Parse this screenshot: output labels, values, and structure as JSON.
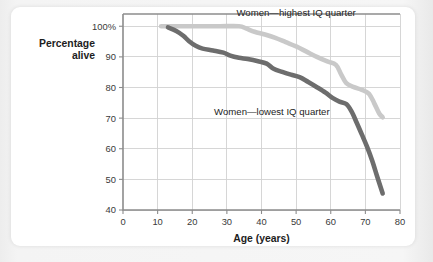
{
  "figure": {
    "card_background": "#ffffff",
    "page_background": "#f2f2f2"
  },
  "chart_data": {
    "type": "line",
    "title": "",
    "subtitle": "",
    "xlabel": "Age (years)",
    "ylabel": "Percentage\nalive",
    "ylabel_line1": "Percentage",
    "ylabel_line2": "alive",
    "xlim": [
      0,
      80
    ],
    "ylim": [
      40,
      104
    ],
    "xticks": [
      0,
      10,
      20,
      30,
      40,
      50,
      60,
      70,
      80
    ],
    "xtick_labels": [
      "0",
      "10",
      "20",
      "30",
      "40",
      "50",
      "60",
      "70",
      "80"
    ],
    "yticks": [
      40,
      50,
      60,
      70,
      80,
      90,
      100
    ],
    "ytick_labels": [
      "40",
      "50",
      "60",
      "70",
      "80",
      "90",
      "100%"
    ],
    "grid": true,
    "grid_color": "#d2d2d2",
    "legend": "inline-annotations",
    "series": [
      {
        "name": "Women—highest IQ quarter",
        "color": "#c9c9c9",
        "width": 4.6,
        "annotation": {
          "text": "Women—highest IQ quarter",
          "x": 50,
          "y": 103.2
        },
        "points": [
          [
            11.0,
            100.0
          ],
          [
            16.0,
            100.0
          ],
          [
            22.0,
            100.0
          ],
          [
            28.0,
            100.0
          ],
          [
            33.5,
            100.0
          ],
          [
            35.5,
            99.3
          ],
          [
            38.0,
            98.2
          ],
          [
            41.0,
            97.3
          ],
          [
            44.0,
            96.2
          ],
          [
            47.0,
            94.8
          ],
          [
            50.0,
            93.4
          ],
          [
            53.0,
            91.7
          ],
          [
            56.0,
            90.0
          ],
          [
            59.0,
            88.5
          ],
          [
            61.5,
            87.4
          ],
          [
            63.0,
            84.3
          ],
          [
            64.5,
            81.4
          ],
          [
            66.5,
            80.2
          ],
          [
            69.0,
            79.2
          ],
          [
            71.0,
            78.0
          ],
          [
            72.5,
            75.0
          ],
          [
            74.0,
            71.5
          ],
          [
            75.0,
            70.3
          ]
        ]
      },
      {
        "name": "Women—lowest IQ quarter",
        "color": "#6d6d6d",
        "width": 4.6,
        "annotation": {
          "text": "Women—lowest IQ quarter",
          "x": 43,
          "y": 71.0
        },
        "points": [
          [
            13.0,
            99.6
          ],
          [
            15.5,
            98.4
          ],
          [
            17.5,
            96.8
          ],
          [
            19.0,
            95.2
          ],
          [
            21.0,
            93.6
          ],
          [
            23.0,
            92.7
          ],
          [
            26.0,
            92.1
          ],
          [
            29.0,
            91.4
          ],
          [
            31.0,
            90.4
          ],
          [
            33.5,
            89.7
          ],
          [
            36.0,
            89.3
          ],
          [
            39.0,
            88.6
          ],
          [
            41.5,
            87.8
          ],
          [
            43.5,
            86.1
          ],
          [
            46.0,
            85.1
          ],
          [
            48.5,
            84.2
          ],
          [
            51.0,
            83.4
          ],
          [
            53.5,
            81.8
          ],
          [
            56.0,
            80.1
          ],
          [
            58.5,
            78.3
          ],
          [
            60.5,
            76.6
          ],
          [
            62.5,
            75.4
          ],
          [
            64.5,
            74.6
          ],
          [
            66.0,
            72.2
          ],
          [
            67.5,
            68.5
          ],
          [
            69.0,
            64.6
          ],
          [
            70.5,
            60.6
          ],
          [
            72.0,
            56.0
          ],
          [
            73.5,
            50.6
          ],
          [
            75.0,
            45.4
          ]
        ]
      }
    ]
  }
}
